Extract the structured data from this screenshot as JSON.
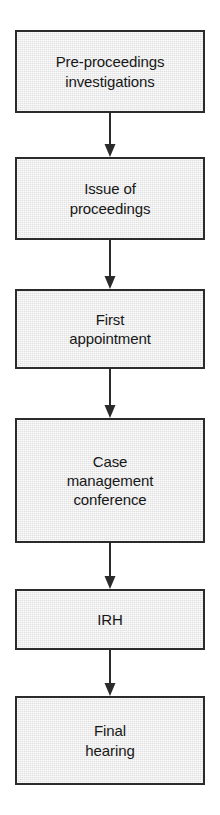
{
  "diagram": {
    "type": "vertical-flowchart",
    "canvas": {
      "width": 220,
      "height": 815
    },
    "style": {
      "box_fill": "#e9e9e9",
      "box_border": "#2b2b2b",
      "text_color": "#171717",
      "arrow_color": "#2b2b2b",
      "background": "#ffffff"
    },
    "nodes": [
      {
        "id": "pre-proceedings-investigations",
        "label": "Pre-proceedings\ninvestigations",
        "line1": "Pre-proceedings",
        "line2": "investigations",
        "order": 1,
        "x": 15,
        "y": 30,
        "width": 190,
        "height": 83
      },
      {
        "id": "issue-of-proceedings",
        "label": "Issue of\nproceedings",
        "line1": "Issue of",
        "line2": "proceedings",
        "order": 2,
        "x": 15,
        "y": 157,
        "width": 190,
        "height": 83
      },
      {
        "id": "first-appointment",
        "label": "First\nappointment",
        "line1": "First",
        "line2": "appointment",
        "order": 3,
        "x": 15,
        "y": 289,
        "width": 190,
        "height": 80
      },
      {
        "id": "case-management-conference",
        "label": "Case\nmanagement\nconference",
        "line1": "Case",
        "line2": "management",
        "line3": "conference",
        "order": 4,
        "x": 15,
        "y": 418,
        "width": 190,
        "height": 125
      },
      {
        "id": "irh",
        "label": "IRH",
        "line1": "IRH",
        "order": 5,
        "x": 15,
        "y": 589,
        "width": 190,
        "height": 61
      },
      {
        "id": "final-hearing",
        "label": "Final\nhearing",
        "line1": "Final",
        "line2": "hearing",
        "order": 6,
        "x": 15,
        "y": 696,
        "width": 190,
        "height": 89
      }
    ],
    "connectors": [
      {
        "id": "arrow-1",
        "from": "pre-proceedings-investigations",
        "to": "issue-of-proceedings",
        "x": 110,
        "y_start": 113,
        "y_end": 157
      },
      {
        "id": "arrow-2",
        "from": "issue-of-proceedings",
        "to": "first-appointment",
        "x": 110,
        "y_start": 240,
        "y_end": 289
      },
      {
        "id": "arrow-3",
        "from": "first-appointment",
        "to": "case-management-conference",
        "x": 110,
        "y_start": 369,
        "y_end": 418
      },
      {
        "id": "arrow-4",
        "from": "case-management-conference",
        "to": "irh",
        "x": 110,
        "y_start": 543,
        "y_end": 589
      },
      {
        "id": "arrow-5",
        "from": "irh",
        "to": "final-hearing",
        "x": 110,
        "y_start": 650,
        "y_end": 696
      }
    ]
  }
}
